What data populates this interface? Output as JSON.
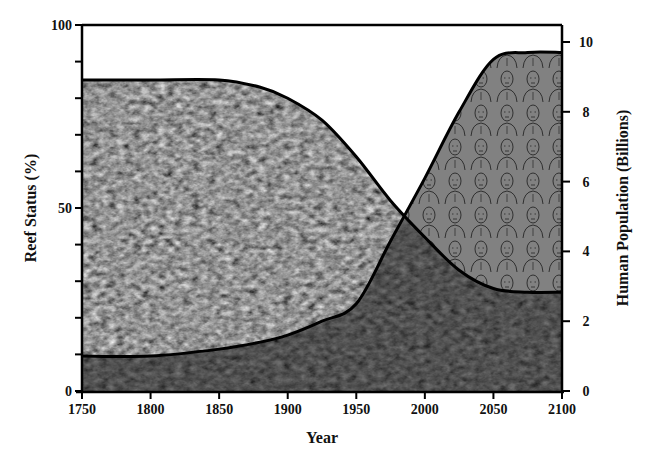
{
  "chart_data": {
    "type": "area",
    "title": "",
    "xlabel": "Year",
    "ylabel": "Reef Status (%)",
    "y2label": "Human Population (Billions)",
    "x": [
      1750,
      1800,
      1850,
      1880,
      1900,
      1925,
      1950,
      1975,
      2000,
      2025,
      2050,
      2075,
      2100
    ],
    "xlim": [
      1750,
      2100
    ],
    "x_ticks": [
      1750,
      1800,
      1850,
      1900,
      1950,
      2000,
      2050,
      2100
    ],
    "ylim": [
      0,
      100
    ],
    "y_ticks": [
      0,
      50,
      100
    ],
    "y2lim": [
      0,
      10
    ],
    "y2_ticks": [
      0,
      2,
      4,
      6,
      8,
      10
    ],
    "series": [
      {
        "name": "Reef Status (%)",
        "axis": "left",
        "fill": "coral reef photo texture",
        "values": [
          85,
          85,
          85,
          83,
          80,
          74,
          64,
          52,
          42,
          33,
          28,
          27,
          27
        ]
      },
      {
        "name": "Human Population (Billions)",
        "axis": "right",
        "fill": "crowd of people illustration",
        "values": [
          1.0,
          1.0,
          1.2,
          1.4,
          1.6,
          2.0,
          2.5,
          4.3,
          6.1,
          8.0,
          9.5,
          9.7,
          9.7
        ]
      }
    ],
    "grid": false,
    "legend": "none"
  },
  "axes": {
    "left_ticks": [
      "0",
      "50",
      "100"
    ],
    "right_ticks": [
      "0",
      "2",
      "4",
      "6",
      "8",
      "10"
    ],
    "x_ticks": [
      "1750",
      "1800",
      "1850",
      "1900",
      "1950",
      "2000",
      "2050",
      "2100"
    ],
    "x_title": "Year",
    "left_title": "Reef Status (%)",
    "right_title": "Human Population (Billions)"
  }
}
